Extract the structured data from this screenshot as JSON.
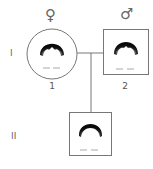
{
  "pedigree": {
    "generations": [
      {
        "label": "I"
      },
      {
        "label": "II"
      }
    ],
    "individuals": [
      {
        "id": "1",
        "label": "1",
        "sex": "female",
        "symbol": "♀",
        "shape": "circle",
        "generation": "I"
      },
      {
        "id": "2",
        "label": "2",
        "sex": "male",
        "symbol": "♂",
        "shape": "square",
        "generation": "I"
      },
      {
        "id": "child",
        "label": "",
        "sex": "male",
        "shape": "square",
        "generation": "II"
      }
    ],
    "colors": {
      "line": "#777777",
      "hair": "#111111"
    }
  }
}
